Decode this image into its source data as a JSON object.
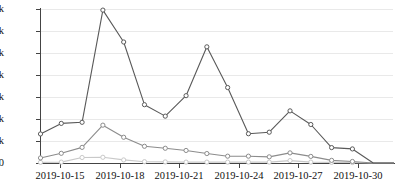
{
  "chart_data": {
    "type": "line",
    "title": "",
    "xlabel": "",
    "ylabel": "",
    "ylim": [
      0,
      70000
    ],
    "xlim": [
      "2019-10-14",
      "2019-10-31"
    ],
    "grid": true,
    "legend": "none",
    "y_ticks": [
      0,
      10000,
      20000,
      30000,
      40000,
      50000,
      60000,
      70000
    ],
    "y_tick_labels": [
      "0",
      "10k",
      "20k",
      "30k",
      "40k",
      "50k",
      "60k",
      "70k"
    ],
    "x_tick_labels": [
      "2019-10-15",
      "2019-10-18",
      "2019-10-21",
      "2019-10-24",
      "2019-10-27",
      "2019-10-30"
    ],
    "x_tick_dates": [
      "2019-10-15",
      "2019-10-18",
      "2019-10-21",
      "2019-10-24",
      "2019-10-27",
      "2019-10-30"
    ],
    "x": [
      "2019-10-14",
      "2019-10-15",
      "2019-10-16",
      "2019-10-17",
      "2019-10-18",
      "2019-10-19",
      "2019-10-20",
      "2019-10-21",
      "2019-10-22",
      "2019-10-23",
      "2019-10-24",
      "2019-10-25",
      "2019-10-26",
      "2019-10-27",
      "2019-10-28",
      "2019-10-29",
      "2019-10-30",
      "2019-10-31"
    ],
    "series": [
      {
        "name": "series-1",
        "color": "#595959",
        "marker": "circle",
        "values": [
          13200,
          18000,
          18500,
          69500,
          55000,
          26500,
          21300,
          30600,
          52800,
          34300,
          13300,
          14000,
          23700,
          17500,
          7000,
          6400,
          0,
          0
        ]
      },
      {
        "name": "series-2",
        "color": "#8c8c8c",
        "marker": "circle",
        "values": [
          2300,
          4400,
          7100,
          17200,
          11700,
          7600,
          6700,
          5700,
          4300,
          3100,
          3100,
          2800,
          4600,
          3000,
          1200,
          700,
          0,
          0
        ]
      },
      {
        "name": "series-3",
        "color": "#c9c9c9",
        "marker": "circle",
        "values": [
          300,
          400,
          2500,
          2600,
          1400,
          600,
          500,
          400,
          400,
          400,
          400,
          400,
          1100,
          400,
          300,
          200,
          0,
          0
        ]
      }
    ]
  },
  "axis": {
    "y_label_suffix": "k",
    "baseline_label": "0"
  },
  "caption": {
    "ghost_text": ""
  }
}
